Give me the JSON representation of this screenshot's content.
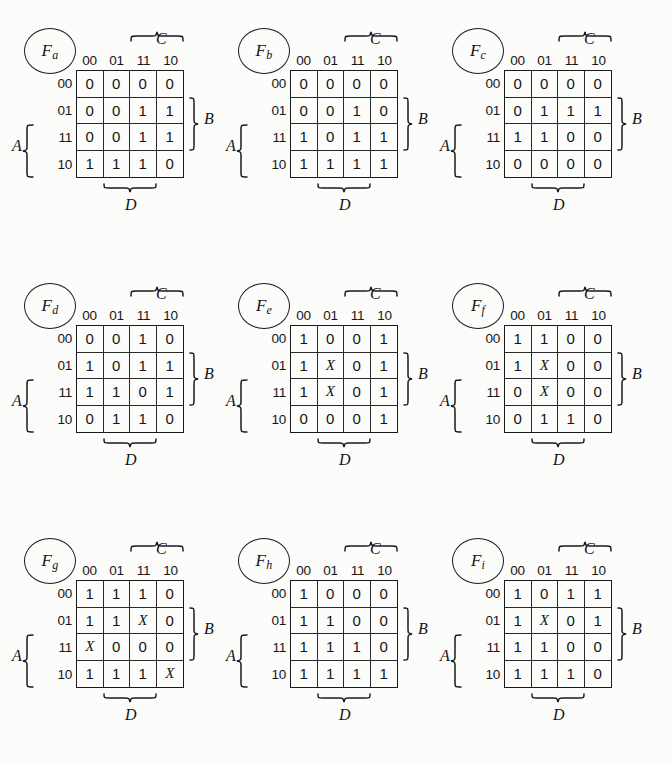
{
  "page": {
    "background_color": "#fcfcfb",
    "ink_color": "#151515",
    "grid_columns": 3,
    "grid_rows": 3
  },
  "legend": {
    "column_headers": [
      "00",
      "01",
      "11",
      "10"
    ],
    "row_headers": [
      "00",
      "01",
      "11",
      "10"
    ],
    "top_variable": "C",
    "right_variable": "B",
    "left_variable": "A",
    "bottom_variable": "D"
  },
  "maps": [
    {
      "name": "F",
      "subscript": "a",
      "rows": [
        [
          "0",
          "0",
          "0",
          "0"
        ],
        [
          "0",
          "0",
          "1",
          "1"
        ],
        [
          "0",
          "0",
          "1",
          "1"
        ],
        [
          "1",
          "1",
          "1",
          "0"
        ]
      ]
    },
    {
      "name": "F",
      "subscript": "b",
      "rows": [
        [
          "0",
          "0",
          "0",
          "0"
        ],
        [
          "0",
          "0",
          "1",
          "0"
        ],
        [
          "1",
          "0",
          "1",
          "1"
        ],
        [
          "1",
          "1",
          "1",
          "1"
        ]
      ]
    },
    {
      "name": "F",
      "subscript": "c",
      "rows": [
        [
          "0",
          "0",
          "0",
          "0"
        ],
        [
          "0",
          "1",
          "1",
          "1"
        ],
        [
          "1",
          "1",
          "0",
          "0"
        ],
        [
          "0",
          "0",
          "0",
          "0"
        ]
      ]
    },
    {
      "name": "F",
      "subscript": "d",
      "rows": [
        [
          "0",
          "0",
          "1",
          "0"
        ],
        [
          "1",
          "0",
          "1",
          "1"
        ],
        [
          "1",
          "1",
          "0",
          "1"
        ],
        [
          "0",
          "1",
          "1",
          "0"
        ]
      ]
    },
    {
      "name": "F",
      "subscript": "e",
      "rows": [
        [
          "1",
          "0",
          "0",
          "1"
        ],
        [
          "1",
          "X",
          "0",
          "1"
        ],
        [
          "1",
          "X",
          "0",
          "1"
        ],
        [
          "0",
          "0",
          "0",
          "1"
        ]
      ]
    },
    {
      "name": "F",
      "subscript": "f",
      "rows": [
        [
          "1",
          "1",
          "0",
          "0"
        ],
        [
          "1",
          "X",
          "0",
          "0"
        ],
        [
          "0",
          "X",
          "0",
          "0"
        ],
        [
          "0",
          "1",
          "1",
          "0"
        ]
      ]
    },
    {
      "name": "F",
      "subscript": "g",
      "rows": [
        [
          "1",
          "1",
          "1",
          "0"
        ],
        [
          "1",
          "1",
          "X",
          "0"
        ],
        [
          "X",
          "0",
          "0",
          "0"
        ],
        [
          "1",
          "1",
          "1",
          "X"
        ]
      ]
    },
    {
      "name": "F",
      "subscript": "h",
      "rows": [
        [
          "1",
          "0",
          "0",
          "0"
        ],
        [
          "1",
          "1",
          "0",
          "0"
        ],
        [
          "1",
          "1",
          "1",
          "0"
        ],
        [
          "1",
          "1",
          "1",
          "1"
        ]
      ]
    },
    {
      "name": "F",
      "subscript": "i",
      "rows": [
        [
          "1",
          "0",
          "1",
          "1"
        ],
        [
          "1",
          "X",
          "0",
          "1"
        ],
        [
          "1",
          "1",
          "0",
          "0"
        ],
        [
          "1",
          "1",
          "1",
          "0"
        ]
      ]
    }
  ]
}
